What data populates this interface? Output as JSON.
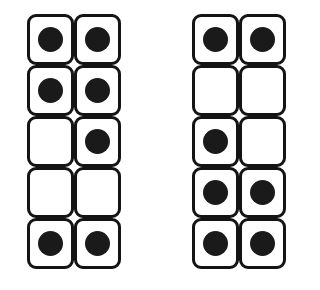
{
  "canvas": {
    "width": 320,
    "height": 290,
    "background_color": "#ffffff"
  },
  "style": {
    "cell_border_color": "#141414",
    "cell_fill_color": "#ffffff",
    "dot_color": "#1a1a1a",
    "cell_border_width_px": 3,
    "cell_corner_radius_px": 9,
    "cell_width_px": 47,
    "cell_height_px": 51,
    "dot_diameter_px": 25
  },
  "grids": [
    {
      "id": "left",
      "name": "left-grid",
      "rows": 5,
      "columns": 2,
      "filled_count": 7,
      "empty_count": 3,
      "cells": [
        [
          {
            "filled": true,
            "state": "filled"
          },
          {
            "filled": true,
            "state": "filled"
          }
        ],
        [
          {
            "filled": true,
            "state": "filled"
          },
          {
            "filled": true,
            "state": "filled"
          }
        ],
        [
          {
            "filled": false,
            "state": "empty"
          },
          {
            "filled": true,
            "state": "filled"
          }
        ],
        [
          {
            "filled": false,
            "state": "empty"
          },
          {
            "filled": false,
            "state": "empty"
          }
        ],
        [
          {
            "filled": true,
            "state": "filled"
          },
          {
            "filled": true,
            "state": "filled"
          }
        ]
      ]
    },
    {
      "id": "right",
      "name": "right-grid",
      "rows": 5,
      "columns": 2,
      "filled_count": 7,
      "empty_count": 3,
      "cells": [
        [
          {
            "filled": true,
            "state": "filled"
          },
          {
            "filled": true,
            "state": "filled"
          }
        ],
        [
          {
            "filled": false,
            "state": "empty"
          },
          {
            "filled": false,
            "state": "empty"
          }
        ],
        [
          {
            "filled": true,
            "state": "filled"
          },
          {
            "filled": false,
            "state": "empty"
          }
        ],
        [
          {
            "filled": true,
            "state": "filled"
          },
          {
            "filled": true,
            "state": "filled"
          }
        ],
        [
          {
            "filled": true,
            "state": "filled"
          },
          {
            "filled": true,
            "state": "filled"
          }
        ]
      ]
    }
  ]
}
